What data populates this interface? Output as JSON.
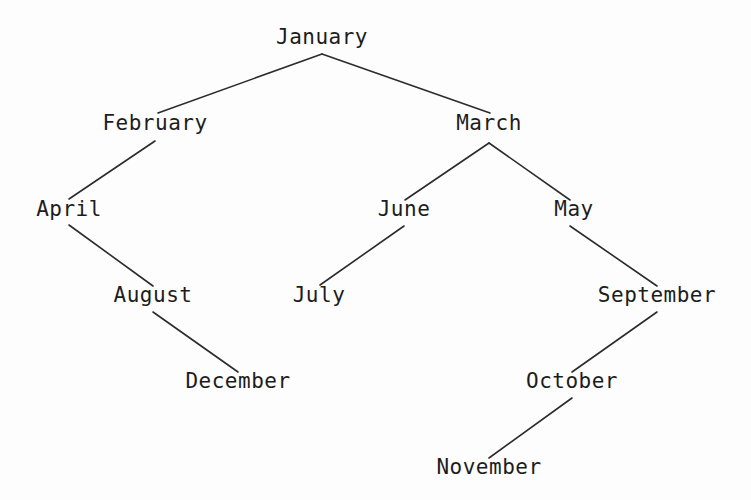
{
  "diagram": {
    "type": "tree",
    "title": "",
    "background_color": "#fdfdfd",
    "line_color": "#2b2b2b",
    "text_color": "#1c1c1c",
    "root": "January",
    "nodes": [
      {
        "id": "january",
        "label": "January",
        "x": 322,
        "y": 48,
        "depth": 0,
        "anchor_x": 322,
        "anchor_top": 54,
        "anchor_bottom": 54
      },
      {
        "id": "february",
        "label": "February",
        "x": 155,
        "y": 134,
        "depth": 1,
        "anchor_x": 155,
        "anchor_top": 113,
        "anchor_bottom": 141
      },
      {
        "id": "march",
        "label": "March",
        "x": 489,
        "y": 134,
        "depth": 1,
        "anchor_x": 489,
        "anchor_top": 113,
        "anchor_bottom": 143
      },
      {
        "id": "april",
        "label": "April",
        "x": 69,
        "y": 220,
        "depth": 2,
        "anchor_x": 69,
        "anchor_top": 199,
        "anchor_bottom": 225
      },
      {
        "id": "june",
        "label": "June",
        "x": 404,
        "y": 220,
        "depth": 2,
        "anchor_x": 404,
        "anchor_top": 200,
        "anchor_bottom": 226
      },
      {
        "id": "may",
        "label": "May",
        "x": 574,
        "y": 220,
        "depth": 2,
        "anchor_x": 570,
        "anchor_top": 200,
        "anchor_bottom": 226
      },
      {
        "id": "august",
        "label": "August",
        "x": 153,
        "y": 306,
        "depth": 3,
        "anchor_x": 153,
        "anchor_top": 286,
        "anchor_bottom": 312
      },
      {
        "id": "july",
        "label": "July",
        "x": 319,
        "y": 306,
        "depth": 3,
        "anchor_x": 320,
        "anchor_top": 285,
        "anchor_bottom": 312
      },
      {
        "id": "september",
        "label": "September",
        "x": 657,
        "y": 306,
        "depth": 3,
        "anchor_x": 657,
        "anchor_top": 286,
        "anchor_bottom": 312
      },
      {
        "id": "december",
        "label": "December",
        "x": 238,
        "y": 392,
        "depth": 4,
        "anchor_x": 238,
        "anchor_top": 372,
        "anchor_bottom": 398
      },
      {
        "id": "october",
        "label": "October",
        "x": 572,
        "y": 392,
        "depth": 4,
        "anchor_x": 572,
        "anchor_top": 372,
        "anchor_bottom": 398
      },
      {
        "id": "november",
        "label": "November",
        "x": 489,
        "y": 478,
        "depth": 5,
        "anchor_x": 489,
        "anchor_top": 458,
        "anchor_bottom": 484
      }
    ],
    "edges": [
      {
        "id": "edge-january-february",
        "from": "january",
        "to": "february",
        "x1": 322,
        "y1": 54,
        "x2": 158,
        "y2": 113
      },
      {
        "id": "edge-january-march",
        "from": "january",
        "to": "march",
        "x1": 322,
        "y1": 54,
        "x2": 490,
        "y2": 113
      },
      {
        "id": "edge-february-april",
        "from": "february",
        "to": "april",
        "x1": 155,
        "y1": 141,
        "x2": 69,
        "y2": 199
      },
      {
        "id": "edge-april-august",
        "from": "april",
        "to": "august",
        "x1": 69,
        "y1": 225,
        "x2": 153,
        "y2": 286
      },
      {
        "id": "edge-august-december",
        "from": "august",
        "to": "december",
        "x1": 153,
        "y1": 312,
        "x2": 238,
        "y2": 372
      },
      {
        "id": "edge-march-june",
        "from": "march",
        "to": "june",
        "x1": 489,
        "y1": 143,
        "x2": 405,
        "y2": 200
      },
      {
        "id": "edge-march-may",
        "from": "march",
        "to": "may",
        "x1": 489,
        "y1": 143,
        "x2": 570,
        "y2": 200
      },
      {
        "id": "edge-june-july",
        "from": "june",
        "to": "july",
        "x1": 404,
        "y1": 226,
        "x2": 320,
        "y2": 285
      },
      {
        "id": "edge-may-september",
        "from": "may",
        "to": "september",
        "x1": 570,
        "y1": 226,
        "x2": 657,
        "y2": 286
      },
      {
        "id": "edge-september-october",
        "from": "september",
        "to": "october",
        "x1": 657,
        "y1": 312,
        "x2": 572,
        "y2": 372
      },
      {
        "id": "edge-october-november",
        "from": "october",
        "to": "november",
        "x1": 572,
        "y1": 398,
        "x2": 489,
        "y2": 458
      }
    ]
  }
}
